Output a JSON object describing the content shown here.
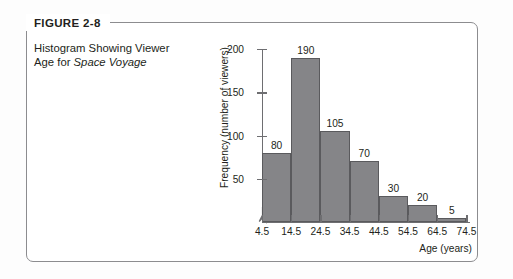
{
  "figure": {
    "tag": "FIGURE 2-8",
    "caption_line1": "Histogram Showing Viewer",
    "caption_line2_prefix": "Age for ",
    "caption_line2_italic": "Space Voyage"
  },
  "colors": {
    "bar_fill": "#858588",
    "bar_stroke": "#5a5a5d",
    "axis": "#6e6e71",
    "frame": "#8c8c8f",
    "text": "#231f20"
  },
  "chart_data": {
    "type": "bar",
    "title": "Histogram Showing Viewer Age for Space Voyage",
    "xlabel": "Age (years)",
    "ylabel": "Frequency (number of viewers)",
    "categories": [
      "4.5-14.5",
      "14.5-24.5",
      "24.5-34.5",
      "34.5-44.5",
      "44.5-54.5",
      "54.5-64.5",
      "64.5-74.5"
    ],
    "values": [
      80,
      190,
      105,
      70,
      30,
      20,
      5
    ],
    "bar_labels": [
      "80",
      "190",
      "105",
      "70",
      "30",
      "20",
      "5"
    ],
    "x_tick_labels": [
      "4.5",
      "14.5",
      "24.5",
      "34.5",
      "44.5",
      "54.5",
      "64.5",
      "74.5"
    ],
    "x_tick_values": [
      4.5,
      14.5,
      24.5,
      34.5,
      44.5,
      54.5,
      64.5,
      74.5
    ],
    "y_tick_labels": [
      "50",
      "100",
      "150",
      "200"
    ],
    "y_tick_values": [
      50,
      100,
      150,
      200
    ],
    "ylim": [
      0,
      200
    ],
    "grid": false,
    "legend": "none",
    "axis_break": "y-axis-break-zigzag"
  }
}
